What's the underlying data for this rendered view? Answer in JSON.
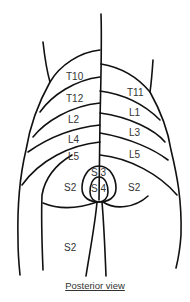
{
  "diagram": {
    "type": "dermatome-map",
    "view": "posterior",
    "caption": "Posterior view",
    "left_labels": [
      "T10",
      "T12",
      "L2",
      "L4",
      "L5",
      "S2",
      "S2"
    ],
    "right_labels": [
      "T11",
      "L1",
      "L3",
      "L5",
      "S2"
    ],
    "center_labels": [
      "S 3",
      "S 4"
    ],
    "line_color": "#111111",
    "text_color": "#333333"
  }
}
